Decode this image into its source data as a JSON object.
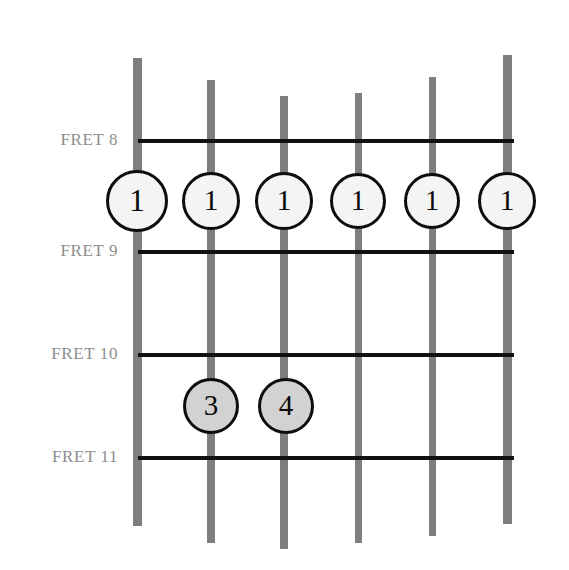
{
  "diagram": {
    "type": "guitar-fretboard-chord-diagram",
    "background_color": "#ffffff",
    "string_color": "#7e7e7e",
    "fret_line_color": "#111111",
    "label_color": "#8d8d8d",
    "marker_border_color": "#0d0d0d",
    "marker_open_fill": "#f4f4f4",
    "marker_filled_fill": "#d2d2d2",
    "string_count": 6,
    "fret_count": 4
  },
  "fret_labels": [
    {
      "text": "FRET 8",
      "y": 131
    },
    {
      "text": "FRET 9",
      "y": 242
    },
    {
      "text": "FRET 10",
      "y": 345
    },
    {
      "text": "FRET 11",
      "y": 448
    }
  ],
  "fret_lines": [
    {
      "name": "fret-8",
      "y": 139,
      "x": 138,
      "width": 376
    },
    {
      "name": "fret-9",
      "y": 250,
      "x": 138,
      "width": 376
    },
    {
      "name": "fret-10",
      "y": 353,
      "x": 138,
      "width": 376
    },
    {
      "name": "fret-11",
      "y": 456,
      "x": 138,
      "width": 376
    }
  ],
  "strings": [
    {
      "name": "string-1",
      "x": 133,
      "width": 9,
      "top": 58,
      "bottom": 526
    },
    {
      "name": "string-2",
      "x": 207,
      "width": 8,
      "top": 80,
      "bottom": 543
    },
    {
      "name": "string-3",
      "x": 280,
      "width": 8,
      "top": 96,
      "bottom": 549
    },
    {
      "name": "string-4",
      "x": 355,
      "width": 7,
      "top": 93,
      "bottom": 543
    },
    {
      "name": "string-5",
      "x": 429,
      "width": 7,
      "top": 77,
      "bottom": 536
    },
    {
      "name": "string-6",
      "x": 503,
      "width": 9,
      "top": 55,
      "bottom": 524
    }
  ],
  "markers": [
    {
      "finger": "1",
      "string": 1,
      "fret": 8,
      "cx": 137,
      "cy": 201,
      "d": 62,
      "fill": "open",
      "font_size": 32
    },
    {
      "finger": "1",
      "string": 2,
      "fret": 8,
      "cx": 211,
      "cy": 201,
      "d": 58,
      "fill": "open",
      "font_size": 30
    },
    {
      "finger": "1",
      "string": 3,
      "fret": 8,
      "cx": 284,
      "cy": 201,
      "d": 58,
      "fill": "open",
      "font_size": 30
    },
    {
      "finger": "1",
      "string": 4,
      "fret": 8,
      "cx": 358,
      "cy": 201,
      "d": 56,
      "fill": "open",
      "font_size": 29
    },
    {
      "finger": "1",
      "string": 5,
      "fret": 8,
      "cx": 432,
      "cy": 201,
      "d": 56,
      "fill": "open",
      "font_size": 29
    },
    {
      "finger": "1",
      "string": 6,
      "fret": 8,
      "cx": 507,
      "cy": 201,
      "d": 58,
      "fill": "open",
      "font_size": 30
    },
    {
      "finger": "3",
      "string": 2,
      "fret": 10,
      "cx": 211,
      "cy": 406,
      "d": 56,
      "fill": "filled",
      "font_size": 29
    },
    {
      "finger": "4",
      "string": 3,
      "fret": 10,
      "cx": 286,
      "cy": 406,
      "d": 56,
      "fill": "filled",
      "font_size": 29
    }
  ]
}
